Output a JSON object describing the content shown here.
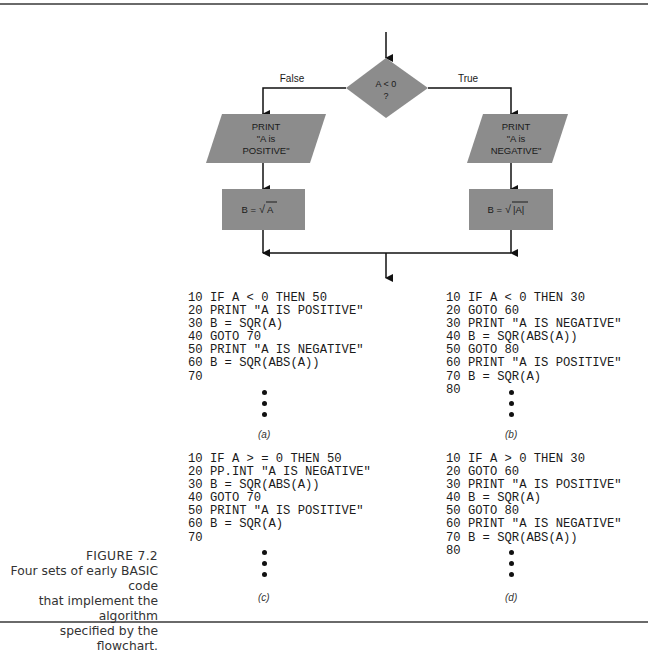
{
  "flowchart": {
    "decision": {
      "line1": "A < 0",
      "line2": "?"
    },
    "false_label": "False",
    "true_label": "True",
    "left_print": {
      "line1": "PRINT",
      "line2": "\"A is",
      "line3": "POSITIVE\""
    },
    "right_print": {
      "line1": "PRINT",
      "line2": "\"A is",
      "line3": "NEGATIVE\""
    },
    "left_assign": {
      "lhs": "B =",
      "radical": "√",
      "radicand": "A"
    },
    "right_assign": {
      "lhs": "B =",
      "radical": "√",
      "radicand": "|A|"
    },
    "shape_fill": "#8c8c8c"
  },
  "code_blocks": [
    {
      "label": "(a)",
      "lines": [
        "10 IF A < 0 THEN 50",
        "20 PRINT \"A IS POSITIVE\"",
        "30 B = SQR(A)",
        "40 GOTO 70",
        "50 PRINT \"A IS NEGATIVE\"",
        "60 B = SQR(ABS(A))",
        "70"
      ]
    },
    {
      "label": "(b)",
      "lines": [
        "10 IF A < 0 THEN 30",
        "20 GOTO 60",
        "30 PRINT \"A IS NEGATIVE\"",
        "40 B = SQR(ABS(A))",
        "50 GOTO 80",
        "60 PRINT \"A IS POSITIVE\"",
        "70 B = SQR(A)",
        "80"
      ]
    },
    {
      "label": "(c)",
      "lines": [
        "10 IF A > = 0 THEN 50",
        "20 PP.INT \"A IS NEGATIVE\"",
        "30 B = SQR(ABS(A))",
        "40 GOTO 70",
        "50 PRINT \"A IS POSITIVE\"",
        "60 B = SQR(A)",
        "70"
      ]
    },
    {
      "label": "(d)",
      "lines": [
        "10 IF A > 0 THEN 30",
        "20 GOTO 60",
        "30 PRINT \"A IS POSITIVE\"",
        "40 B = SQR(A)",
        "50 GOTO 80",
        "60 PRINT \"A IS NEGATIVE\"",
        "70 B = SQR(ABS(A))",
        "80"
      ]
    }
  ],
  "caption": {
    "figure": "FIGURE 7.2",
    "line1": "Four sets of early BASIC code",
    "line2": "that implement the algorithm",
    "line3": "specified by the flowchart."
  }
}
